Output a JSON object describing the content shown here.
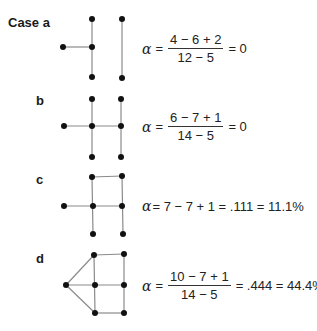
{
  "cases": [
    {
      "label": "Case a",
      "formula": {
        "numerator": "4 − 6 + 2",
        "denominator": "12 − 5",
        "result": "= 0"
      }
    },
    {
      "label": "b",
      "formula": {
        "numerator": "6 − 7 + 1",
        "denominator": "14 − 5",
        "result": "= 0"
      }
    },
    {
      "label": "c",
      "formula": {
        "text": "= 7 − 7 + 1 = .111 = 11.1%"
      }
    },
    {
      "label": "d",
      "formula": {
        "numerator": "10 − 7 + 1",
        "denominator": "14 − 5",
        "result": "= .444 = 44.4%"
      }
    }
  ],
  "symbols": {
    "alpha": "α",
    "equals": "="
  },
  "colors": {
    "node": "#111111",
    "edge": "#8a8a8a",
    "text": "#1a1a1a"
  }
}
